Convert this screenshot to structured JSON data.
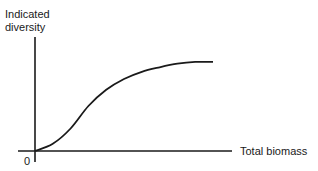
{
  "chart_data": {
    "type": "line",
    "title": "",
    "xlabel": "Total biomass",
    "ylabel": "Indicated diversity",
    "origin_label": "0",
    "grid": false,
    "legend": null,
    "series": [
      {
        "name": "diversity vs biomass (sigmoid, saturating)",
        "x": [
          0,
          0.1,
          0.2,
          0.3,
          0.4,
          0.5,
          0.6,
          0.7,
          0.8,
          0.9,
          1.0
        ],
        "y": [
          0,
          0.08,
          0.25,
          0.5,
          0.68,
          0.8,
          0.88,
          0.93,
          0.97,
          0.99,
          0.99
        ]
      }
    ],
    "xlim": [
      0,
      1.1
    ],
    "ylim": [
      0,
      1.2
    ]
  },
  "labels": {
    "y_axis_line1": "Indicated",
    "y_axis_line2": "diversity",
    "x_axis": "Total biomass",
    "origin": "0"
  }
}
